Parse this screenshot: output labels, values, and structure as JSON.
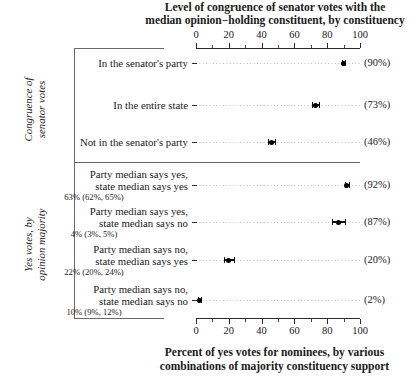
{
  "chart_data": {
    "type": "scatter",
    "title_line1": "Level of congruence of senator votes with the",
    "title_line2": "median opinion−holding constituent, by constituency",
    "xlabel_line1": "Percent of yes votes for nominees, by various",
    "xlabel_line2": "combinations of majority constituency support",
    "xlim": [
      0,
      100
    ],
    "xticks": [
      0,
      20,
      40,
      60,
      80,
      100
    ],
    "xticklabels": [
      "0",
      "20",
      "40",
      "60",
      "80",
      "100"
    ],
    "minor_ticks": [
      10,
      30,
      50,
      70,
      90
    ],
    "grid": "dotted-horizontal-guides",
    "axis_positions": "top-and-bottom",
    "legend": "none",
    "panels": [
      {
        "group_label_line1": "Congruence of",
        "group_label_line2": "senator votes",
        "rows": [
          {
            "label_line1": "In the senator's party",
            "label_line2": "",
            "sublabel": "",
            "value": 90,
            "ci_low": 89,
            "ci_high": 91,
            "value_text": "(90%)"
          },
          {
            "label_line1": "In the entire state",
            "label_line2": "",
            "sublabel": "",
            "value": 73,
            "ci_low": 71,
            "ci_high": 75,
            "value_text": "(73%)"
          },
          {
            "label_line1": "Not in the senator's party",
            "label_line2": "",
            "sublabel": "",
            "value": 46,
            "ci_low": 44,
            "ci_high": 48,
            "value_text": "(46%)"
          }
        ]
      },
      {
        "group_label_line1": "Yes votes, by",
        "group_label_line2": "opinion majority",
        "rows": [
          {
            "label_line1": "Party median says yes,",
            "label_line2": "state median says yes",
            "sublabel": "63% (62%, 65%)",
            "value": 92,
            "ci_low": 91,
            "ci_high": 93,
            "value_text": "(92%)"
          },
          {
            "label_line1": "Party median says yes,",
            "label_line2": "state median says no",
            "sublabel": "4% (3%, 5%)",
            "value": 87,
            "ci_low": 83,
            "ci_high": 91,
            "value_text": "(87%)"
          },
          {
            "label_line1": "Party median says no,",
            "label_line2": "state median says yes",
            "sublabel": "22% (20%, 24%)",
            "value": 20,
            "ci_low": 17,
            "ci_high": 23,
            "value_text": "(20%)"
          },
          {
            "label_line1": "Party median says no,",
            "label_line2": "state median says no",
            "sublabel": "10% (9%, 12%)",
            "value": 2,
            "ci_low": 1,
            "ci_high": 3,
            "value_text": "(2%)"
          }
        ]
      }
    ]
  }
}
